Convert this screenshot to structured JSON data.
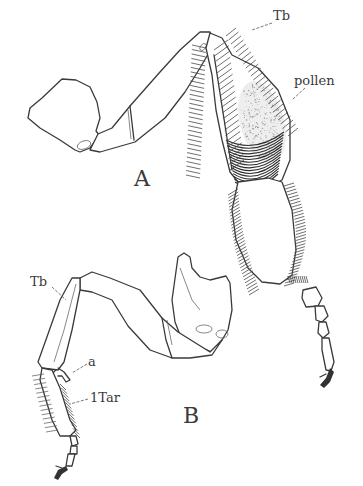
{
  "figure": {
    "ink_color": "#3a3a3a",
    "background_color": "#ffffff",
    "panels": [
      {
        "id": "A",
        "label": "A",
        "annotations": [
          {
            "key": "tb",
            "text": "Tb"
          },
          {
            "key": "pollen",
            "text": "pollen"
          }
        ]
      },
      {
        "id": "B",
        "label": "B",
        "annotations": [
          {
            "key": "tb",
            "text": "Tb"
          },
          {
            "key": "a",
            "text": "a"
          },
          {
            "key": "tar",
            "text": "1Tar"
          }
        ]
      }
    ]
  }
}
